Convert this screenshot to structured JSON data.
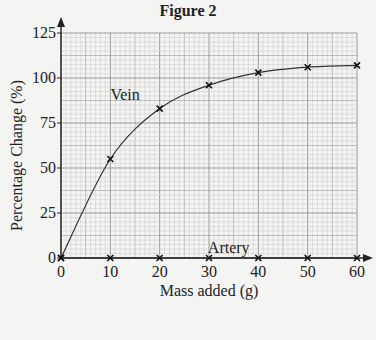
{
  "chart_data": {
    "type": "line",
    "title": "Figure 2",
    "xlabel": "Mass added (g)",
    "ylabel": "Percentage Change (%)",
    "x": [
      0,
      10,
      20,
      30,
      40,
      50,
      60
    ],
    "xlim": [
      0,
      60
    ],
    "ylim": [
      0,
      125
    ],
    "xticks": [
      "0",
      "10",
      "20",
      "30",
      "40",
      "50",
      "60"
    ],
    "yticks": [
      "0",
      "25",
      "50",
      "75",
      "100",
      "125"
    ],
    "grid": true,
    "series": [
      {
        "name": "Vein",
        "values": [
          0,
          55,
          83,
          96,
          103,
          106,
          107
        ]
      },
      {
        "name": "Artery",
        "values": [
          0,
          0,
          0,
          0,
          0,
          0,
          0
        ]
      }
    ],
    "annotations": [
      {
        "text": "Vein",
        "x": 13,
        "y": 88
      },
      {
        "text": "Artery",
        "x": 34,
        "y": 3
      }
    ]
  }
}
